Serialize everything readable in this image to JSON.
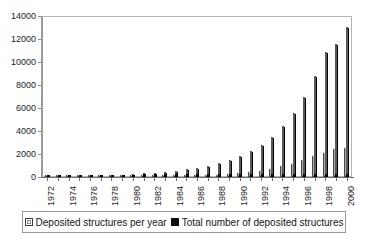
{
  "chart_data": {
    "type": "bar",
    "title": "",
    "subtitle": "",
    "xlabel": "",
    "ylabel": "",
    "ylim": [
      0,
      14000
    ],
    "ytick_labels": [
      "14000",
      "12000",
      "10000",
      "8000",
      "6000",
      "4000",
      "2000",
      "0"
    ],
    "yticks": [
      14000,
      12000,
      10000,
      8000,
      6000,
      4000,
      2000,
      0
    ],
    "grid": false,
    "legend_position": "bottom",
    "categories": [
      "1972",
      "1973",
      "1974",
      "1975",
      "1976",
      "1977",
      "1978",
      "1979",
      "1980",
      "1981",
      "1982",
      "1983",
      "1984",
      "1985",
      "1986",
      "1987",
      "1988",
      "1989",
      "1990",
      "1991",
      "1992",
      "1993",
      "1994",
      "1995",
      "1996",
      "1997",
      "1998",
      "1999",
      "2000"
    ],
    "xtick_labels": [
      "1972",
      "",
      "1974",
      "",
      "1976",
      "",
      "1978",
      "",
      "1980",
      "",
      "1982",
      "",
      "1984",
      "",
      "1986",
      "",
      "1988",
      "",
      "1990",
      "",
      "1992",
      "",
      "1994",
      "",
      "1996",
      "",
      "1998",
      "",
      "2000"
    ],
    "series": [
      {
        "name": "Deposited structures per year",
        "color": "#a8a8a8",
        "values": [
          10,
          8,
          12,
          14,
          18,
          22,
          30,
          35,
          40,
          55,
          60,
          75,
          90,
          110,
          145,
          185,
          210,
          275,
          330,
          415,
          520,
          700,
          950,
          1150,
          1450,
          1800,
          2100,
          2400,
          2500
        ]
      },
      {
        "name": "Total number of deposited structures",
        "color": "#121212",
        "values": [
          10,
          18,
          30,
          44,
          62,
          84,
          114,
          149,
          189,
          244,
          304,
          379,
          469,
          579,
          724,
          909,
          1119,
          1394,
          1724,
          2139,
          2659,
          3359,
          4309,
          5459,
          6909,
          8709,
          10809,
          11500,
          13000
        ]
      }
    ]
  },
  "legend": {
    "items": [
      {
        "label": "Deposited structures per year",
        "swatch": "gray-square-icon"
      },
      {
        "label": "Total number of deposited structures",
        "swatch": "black-square-icon"
      }
    ]
  }
}
